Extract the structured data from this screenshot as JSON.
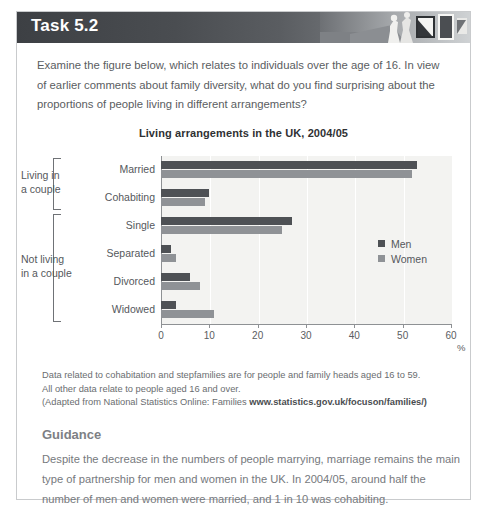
{
  "header": {
    "title": "Task 5.2",
    "photo_alt": "header-photo"
  },
  "intro": "Examine the figure below, which relates to individuals over the age of 16. In view of earlier comments about family diversity, what do you find surprising about the proportions of people living in different arrangements?",
  "chart_data": {
    "type": "bar",
    "orientation": "horizontal",
    "title": "Living arrangements in the UK, 2004/05",
    "xlabel": "%",
    "ylabel": "",
    "xlim": [
      0,
      60
    ],
    "xticks": [
      0,
      10,
      20,
      30,
      40,
      50,
      60
    ],
    "grid": true,
    "legend_position": "inside-right",
    "categories": [
      "Married",
      "Cohabiting",
      "Single",
      "Separated",
      "Divorced",
      "Widowed"
    ],
    "groups": [
      {
        "label": "Living in\na couple",
        "label_line1": "Living in",
        "label_line2": "a couple",
        "categories": [
          "Married",
          "Cohabiting"
        ]
      },
      {
        "label": "Not living\nin a couple",
        "label_line1": "Not living",
        "label_line2": "in a couple",
        "categories": [
          "Single",
          "Separated",
          "Divorced",
          "Widowed"
        ]
      }
    ],
    "series": [
      {
        "name": "Men",
        "color": "#4e5155",
        "values": [
          53,
          10,
          27,
          2,
          6,
          3
        ]
      },
      {
        "name": "Women",
        "color": "#8f9296",
        "values": [
          52,
          9,
          25,
          3,
          8,
          11
        ]
      }
    ]
  },
  "footnote": {
    "line1": "Data related to cohabitation and stepfamilies are for people and family heads aged 16 to 59.",
    "line2": "All other data relate to people aged 16 and over.",
    "source_prefix": "(Adapted from National Statistics Online: Families",
    "source_url": "www.statistics.gov.uk/focuson/families/)"
  },
  "guidance": {
    "heading": "Guidance",
    "body": "Despite the decrease in the numbers of people marrying, marriage remains the main type of partnership for men and women in the UK. In 2004/05, around half the number of men and women were married, and 1 in 10 was cohabiting."
  },
  "colors": {
    "men": "#4e5155",
    "women": "#8f9296",
    "plot_bg": "#f3f3f1",
    "axis": "#8e9194",
    "border": "#c9cbcd"
  }
}
